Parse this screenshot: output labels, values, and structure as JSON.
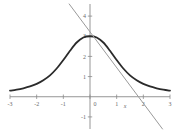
{
  "chart_data": {
    "type": "line",
    "title": "",
    "xlabel": "x",
    "ylabel": "",
    "xlim": [
      -3,
      3
    ],
    "ylim": [
      -1.6,
      4.6
    ],
    "grid": false,
    "legend_position": "none",
    "xticks": [
      -3,
      -2,
      -1,
      0,
      1,
      2,
      3
    ],
    "xtick_labels": [
      "-3",
      "-2",
      "-1",
      "0",
      "1",
      "2",
      "3"
    ],
    "yticks": [
      -1,
      1,
      2,
      3,
      4
    ],
    "ytick_labels": [
      "-1",
      "1",
      "2",
      "3",
      "4"
    ],
    "series": [
      {
        "name": "bell-curve",
        "type": "line",
        "color": "#2b2b2b",
        "width": 1.8,
        "description": "bell shaped curve peaking at 3 when x=0, decaying toward 0.3 at x=±3",
        "x": [
          -3,
          -2.75,
          -2.5,
          -2.25,
          -2,
          -1.75,
          -1.5,
          -1.25,
          -1,
          -0.75,
          -0.5,
          -0.25,
          0,
          0.25,
          0.5,
          0.75,
          1,
          1.25,
          1.5,
          1.75,
          2,
          2.25,
          2.5,
          2.75,
          3
        ],
        "values": [
          0.3,
          0.35,
          0.42,
          0.51,
          0.64,
          0.82,
          1.06,
          1.4,
          1.82,
          2.28,
          2.69,
          2.94,
          3.0,
          2.94,
          2.69,
          2.28,
          1.82,
          1.4,
          1.06,
          0.82,
          0.64,
          0.51,
          0.42,
          0.35,
          0.3
        ]
      },
      {
        "name": "straight-line",
        "type": "line",
        "color": "#9a9a9a",
        "width": 1.0,
        "description": "descending straight line crossing x-axis at x=2 and y-axis at about y=2.6",
        "x": [
          -0.78,
          2.72
        ],
        "values": [
          4.6,
          -1.6
        ]
      }
    ],
    "annotations": [
      {
        "name": "x-axis-label",
        "text": "x",
        "x": 1.32,
        "y": -0.55
      }
    ]
  },
  "colors": {
    "background": "#ffffff",
    "axis": "#8a8a8a",
    "curve": "#2b2b2b",
    "line": "#9a9a9a",
    "tick_text": "#6a6a6a"
  }
}
